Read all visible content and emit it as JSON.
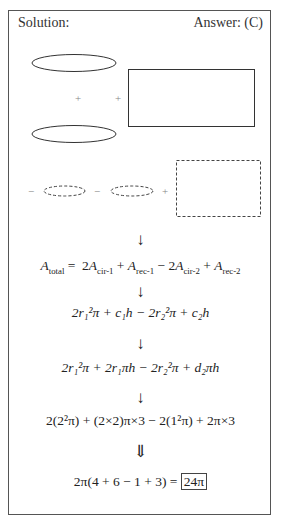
{
  "header": {
    "solution_label": "Solution:",
    "answer_label": "Answer: (C)"
  },
  "diagram": {
    "row1": {
      "operators": [
        "+",
        "+"
      ],
      "shapes": [
        "ellipse-solid-top",
        "ellipse-solid-bottom",
        "rectangle-solid"
      ]
    },
    "row2": {
      "operators": [
        "−",
        "−",
        "+"
      ],
      "shapes": [
        "ellipse-dashed-1",
        "ellipse-dashed-2",
        "rectangle-dashed"
      ]
    },
    "colors": {
      "stroke": "#333333",
      "dashed_stroke": "#444444",
      "frame": "#555555"
    }
  },
  "steps": {
    "arrow": "↓",
    "double_arrow": "⇓",
    "line1": {
      "lhs": "A",
      "lhs_sub": "total",
      "eq": "=",
      "t1_coef": "2",
      "t1_var": "A",
      "t1_sub": "cir-1",
      "op1": "+",
      "t2_var": "A",
      "t2_sub": "rec-1",
      "op2": "−",
      "t3_coef": "2",
      "t3_var": "A",
      "t3_sub": "cir-2",
      "op3": "+",
      "t4_var": "A",
      "t4_sub": "rec-2"
    },
    "line2": "2r₁²π + c₁h − 2r₂²π + c₂h",
    "line3": "2r₁²π + 2r₁πh − 2r₂²π + d₂πh",
    "line4": "2(2²π) + (2×2)π×3 − 2(1²π) + 2π×3",
    "line5": {
      "expr": "2π(4 + 6 − 1 + 3) =",
      "answer": "24π"
    }
  }
}
